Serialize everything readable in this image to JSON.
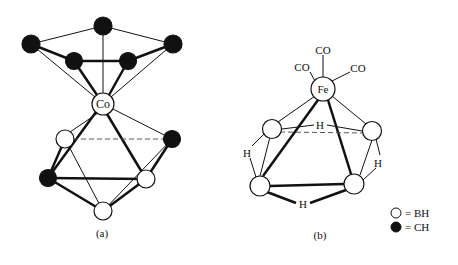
{
  "figure_a": {
    "caption": "(a)",
    "metal_label": "Co"
  },
  "figure_b": {
    "caption": "(b)",
    "metal_label": "Fe",
    "ligands": [
      "CO",
      "CO",
      "CO"
    ],
    "bridging_h": [
      "H",
      "H",
      "H",
      "H"
    ]
  },
  "legend": {
    "items": [
      {
        "symbol": "open-circle",
        "label": "= BH"
      },
      {
        "symbol": "filled-circle",
        "label": "= CH"
      }
    ]
  }
}
